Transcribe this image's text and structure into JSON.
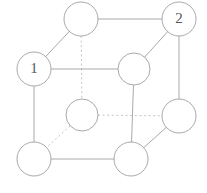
{
  "figure": {
    "background_color": "#ffffff",
    "width": 207,
    "height": 193,
    "solid_edge_color": "#a9a9ad",
    "dashed_edge_color": "#c9c4c9",
    "node_fill_color": "#ffffff",
    "node_stroke_color": "#a9a9ad",
    "label_color": "#59575c"
  },
  "chart_data": {
    "type": "diagram",
    "subtype": "graph-node-link",
    "node_radius": 17,
    "nodes": [
      {
        "id": "top-back",
        "label": "",
        "x": 81,
        "y": 19,
        "r": 17
      },
      {
        "id": "right-back",
        "label": "2",
        "x": 179,
        "y": 19,
        "r": 17
      },
      {
        "id": "left-front",
        "label": "1",
        "x": 34,
        "y": 69,
        "r": 17
      },
      {
        "id": "mid-front",
        "label": "",
        "x": 134,
        "y": 69,
        "r": 16
      },
      {
        "id": "inner-hidden",
        "label": "",
        "x": 82,
        "y": 115,
        "r": 16
      },
      {
        "id": "right-lower",
        "label": "",
        "x": 179,
        "y": 116,
        "r": 17
      },
      {
        "id": "bottom-left",
        "label": "",
        "x": 34,
        "y": 159,
        "r": 17
      },
      {
        "id": "bottom-mid",
        "label": "",
        "x": 131,
        "y": 159,
        "r": 17
      }
    ],
    "edges": [
      {
        "from": "top-back",
        "to": "right-back",
        "style": "solid"
      },
      {
        "from": "top-back",
        "to": "left-front",
        "style": "solid"
      },
      {
        "from": "top-back",
        "to": "inner-hidden",
        "style": "dashed"
      },
      {
        "from": "right-back",
        "to": "mid-front",
        "style": "solid"
      },
      {
        "from": "right-back",
        "to": "right-lower",
        "style": "solid"
      },
      {
        "from": "left-front",
        "to": "mid-front",
        "style": "solid"
      },
      {
        "from": "left-front",
        "to": "bottom-left",
        "style": "solid"
      },
      {
        "from": "mid-front",
        "to": "bottom-mid",
        "style": "solid"
      },
      {
        "from": "inner-hidden",
        "to": "right-lower",
        "style": "dashed"
      },
      {
        "from": "inner-hidden",
        "to": "bottom-left",
        "style": "dashed"
      },
      {
        "from": "right-lower",
        "to": "bottom-mid",
        "style": "solid"
      },
      {
        "from": "bottom-left",
        "to": "bottom-mid",
        "style": "solid"
      }
    ],
    "labels": [
      "1",
      "2"
    ],
    "legend": [],
    "xlabel": "",
    "ylabel": ""
  }
}
